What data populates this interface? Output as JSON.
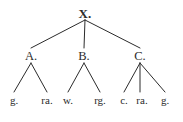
{
  "figure": {
    "kind": "syntax-tree-diagram",
    "width": 183,
    "height": 122,
    "background_color": "#ffffff",
    "line_color": "#2b2b2b",
    "text_color": "#2b2b2b"
  },
  "nodes": {
    "root": {
      "label": "X.",
      "x": 85,
      "y": 13,
      "bold": true
    },
    "internal": [
      {
        "label": "A.",
        "x": 31,
        "y": 56
      },
      {
        "label": "B.",
        "x": 84,
        "y": 56
      },
      {
        "label": "C.",
        "x": 140,
        "y": 56
      }
    ],
    "leaves": [
      {
        "label": "g.",
        "x": 14,
        "y": 100,
        "parent": "A."
      },
      {
        "label": "ra.",
        "x": 47,
        "y": 100,
        "parent": "A."
      },
      {
        "label": "w.",
        "x": 68,
        "y": 100,
        "parent": "B."
      },
      {
        "label": "rg.",
        "x": 100,
        "y": 100,
        "parent": "B."
      },
      {
        "label": "c.",
        "x": 124,
        "y": 100,
        "parent": "C."
      },
      {
        "label": "ra.",
        "x": 142,
        "y": 100,
        "parent": "C."
      },
      {
        "label": "g.",
        "x": 165,
        "y": 100,
        "parent": "C."
      }
    ]
  },
  "edges": [
    {
      "from": "X.",
      "to": "A.",
      "x1": 85,
      "y1": 20,
      "x2": 31,
      "y2": 48
    },
    {
      "from": "X.",
      "to": "B.",
      "x1": 85,
      "y1": 20,
      "x2": 84,
      "y2": 48
    },
    {
      "from": "X.",
      "to": "C.",
      "x1": 85,
      "y1": 20,
      "x2": 140,
      "y2": 48
    },
    {
      "from": "A.",
      "to": "g.",
      "x1": 31,
      "y1": 63,
      "x2": 14,
      "y2": 92
    },
    {
      "from": "A.",
      "to": "ra.",
      "x1": 31,
      "y1": 63,
      "x2": 47,
      "y2": 92
    },
    {
      "from": "B.",
      "to": "w.",
      "x1": 84,
      "y1": 63,
      "x2": 68,
      "y2": 92
    },
    {
      "from": "B.",
      "to": "rg.",
      "x1": 84,
      "y1": 63,
      "x2": 100,
      "y2": 92
    },
    {
      "from": "C.",
      "to": "c.",
      "x1": 140,
      "y1": 63,
      "x2": 124,
      "y2": 92
    },
    {
      "from": "C.",
      "to": "ra.",
      "x1": 140,
      "y1": 63,
      "x2": 140,
      "y2": 92
    },
    {
      "from": "C.",
      "to": "g.",
      "x1": 140,
      "y1": 63,
      "x2": 165,
      "y2": 92
    }
  ]
}
